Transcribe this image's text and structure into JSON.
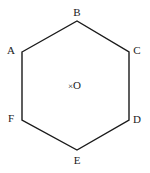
{
  "figure": {
    "type": "regular-hexagon-with-center",
    "width": 150,
    "height": 173,
    "background_color": "#ffffff",
    "stroke_color": "#1a1a1a",
    "stroke_width": 1.4,
    "fill": "none"
  },
  "labels": {
    "a": "A",
    "b": "B",
    "c": "C",
    "d": "D",
    "e": "E",
    "f": "F",
    "center": "O",
    "center_mark": "×"
  },
  "chart_data": {
    "type": "scatter",
    "title": "",
    "xlabel": "",
    "ylabel": "",
    "grid": false,
    "legend": "none",
    "shape": "hexagon",
    "vertices": [
      {
        "name": "A",
        "x": 22,
        "y": 52,
        "label_x": 11,
        "label_y": 50,
        "label_anchor": "left"
      },
      {
        "name": "B",
        "x": 77,
        "y": 21,
        "label_x": 77,
        "label_y": 12,
        "label_anchor": "top"
      },
      {
        "name": "C",
        "x": 129,
        "y": 52,
        "label_x": 137,
        "label_y": 50,
        "label_anchor": "right"
      },
      {
        "name": "D",
        "x": 129,
        "y": 120,
        "label_x": 137,
        "label_y": 119,
        "label_anchor": "right"
      },
      {
        "name": "E",
        "x": 77,
        "y": 150,
        "label_x": 77,
        "label_y": 160,
        "label_anchor": "bottom"
      },
      {
        "name": "F",
        "x": 22,
        "y": 120,
        "label_x": 11,
        "label_y": 118,
        "label_anchor": "left"
      }
    ],
    "center_point": {
      "name": "O",
      "x": 77,
      "y": 86,
      "marker": "cross"
    },
    "polyline_points": "22,52 77,21 129,52 129,120 77,150 22,120",
    "closed": true
  }
}
